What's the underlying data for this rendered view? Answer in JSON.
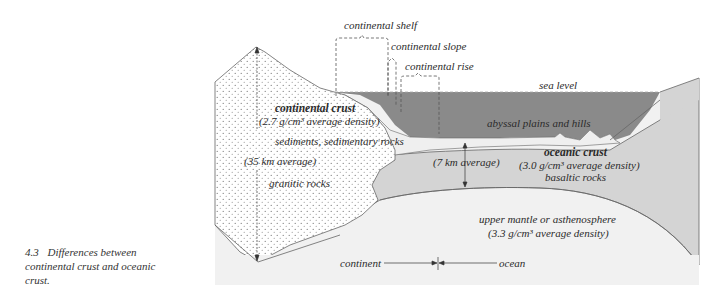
{
  "caption": {
    "number": "4.3",
    "text": "Differences between continental crust and oceanic crust."
  },
  "labels": {
    "continental_shelf": "continental shelf",
    "continental_slope": "continental slope",
    "continental_rise": "continental rise",
    "sea_level": "sea level",
    "continental_crust": "continental crust",
    "continental_density": "(2.7 g/cm³ average density)",
    "sediments": "sediments, sedimentary rocks",
    "continental_thickness": "(35 km average)",
    "granitic_rocks": "granitic rocks",
    "abyssal": "abyssal plains and hills",
    "oceanic_thickness": "(7 km average)",
    "oceanic_crust": "oceanic crust",
    "oceanic_density": "(3.0 g/cm³ average density)",
    "basaltic_rocks": "basaltic rocks",
    "mantle": "upper mantle or asthenosphere",
    "mantle_density": "(3.3 g/cm³ average density)",
    "continent": "continent",
    "ocean": "ocean"
  },
  "colors": {
    "ocean_water": "#8a8a8a",
    "oceanic_crust": "#d4d4d4",
    "mantle": "#f1f1f1",
    "continental_crust": "#ffffff",
    "sediment": "#eeeeee",
    "line": "#555555"
  }
}
